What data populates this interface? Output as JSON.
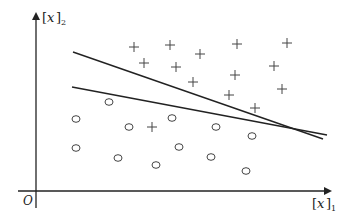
{
  "diagram": {
    "type": "linear-classifier-scatter",
    "axes": {
      "x_label": {
        "base": "x",
        "subscript": "1"
      },
      "y_label": {
        "base": "x",
        "subscript": "2"
      },
      "origin_label": "O"
    },
    "lines": [
      {
        "id": "line-1",
        "from": [
          73,
          52
        ],
        "to": [
          323,
          139
        ]
      },
      {
        "id": "line-2",
        "from": [
          72,
          87
        ],
        "to": [
          327,
          135
        ]
      }
    ],
    "plus_points": [
      [
        134,
        47
      ],
      [
        170,
        45
      ],
      [
        200,
        54
      ],
      [
        237,
        44
      ],
      [
        287,
        43
      ],
      [
        144,
        63
      ],
      [
        176,
        67
      ],
      [
        235,
        75
      ],
      [
        274,
        66
      ],
      [
        193,
        82
      ],
      [
        229,
        95
      ],
      [
        282,
        89
      ],
      [
        255,
        108
      ],
      [
        152,
        127
      ]
    ],
    "circle_points": [
      [
        109,
        102
      ],
      [
        76,
        119
      ],
      [
        129,
        127
      ],
      [
        172,
        118
      ],
      [
        216,
        127
      ],
      [
        252,
        136
      ],
      [
        76,
        148
      ],
      [
        118,
        158
      ],
      [
        156,
        165
      ],
      [
        179,
        147
      ],
      [
        211,
        157
      ],
      [
        246,
        171
      ]
    ],
    "colors": {
      "ink": "#222222",
      "marker": "#444444"
    }
  }
}
